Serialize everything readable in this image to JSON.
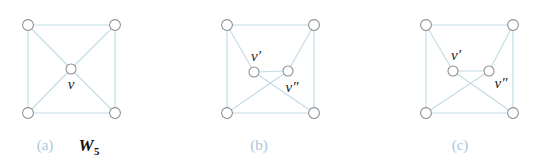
{
  "figure": {
    "background_color": "#ffffff",
    "edge_color": "#c3dce8",
    "node_stroke_color": "#8b8b8b",
    "node_fill_color": "#ffffff",
    "caption_tag_color": "#a8c6da",
    "label_color": "#1b1b1b",
    "width": 544,
    "height": 165
  },
  "panels": [
    {
      "id": "panel-a",
      "caption_tag": "(a)",
      "caption_name": "W",
      "caption_name_sub": "5",
      "caption_tag_x": 45,
      "caption_tag_y": 150,
      "caption_name_x": 86,
      "caption_name_y": 151,
      "nodes": [
        {
          "name": "top-left",
          "x": 28,
          "y": 25,
          "r": 5.4,
          "label": ""
        },
        {
          "name": "top-right",
          "x": 115,
          "y": 25,
          "r": 5.4,
          "label": ""
        },
        {
          "name": "bottom-left",
          "x": 28,
          "y": 113,
          "r": 5.4,
          "label": ""
        },
        {
          "name": "bottom-right",
          "x": 115,
          "y": 113,
          "r": 5.4,
          "label": ""
        },
        {
          "name": "center",
          "x": 71,
          "y": 69,
          "r": 5.0,
          "label": "v",
          "label_x": 71,
          "label_y": 89
        }
      ],
      "edges": [
        {
          "from": "top-left",
          "to": "top-right"
        },
        {
          "from": "top-right",
          "to": "bottom-right"
        },
        {
          "from": "bottom-right",
          "to": "bottom-left"
        },
        {
          "from": "bottom-left",
          "to": "top-left"
        },
        {
          "from": "center",
          "to": "top-left"
        },
        {
          "from": "center",
          "to": "top-right"
        },
        {
          "from": "center",
          "to": "bottom-left"
        },
        {
          "from": "center",
          "to": "bottom-right"
        }
      ]
    },
    {
      "id": "panel-b",
      "caption_tag": "(b)",
      "caption_name": "",
      "caption_name_sub": "",
      "caption_tag_x": 259,
      "caption_tag_y": 150,
      "nodes": [
        {
          "name": "top-left",
          "x": 227,
          "y": 25,
          "r": 5.4,
          "label": ""
        },
        {
          "name": "top-right",
          "x": 314,
          "y": 25,
          "r": 5.4,
          "label": ""
        },
        {
          "name": "bottom-left",
          "x": 227,
          "y": 113,
          "r": 5.4,
          "label": ""
        },
        {
          "name": "bottom-right",
          "x": 314,
          "y": 113,
          "r": 5.4,
          "label": ""
        },
        {
          "name": "v-prime",
          "x": 254,
          "y": 72,
          "r": 5.0,
          "label": "v′",
          "label_x": 256,
          "label_y": 61
        },
        {
          "name": "v-doubleprime",
          "x": 288,
          "y": 71,
          "r": 5.0,
          "label": "v″",
          "label_x": 292,
          "label_y": 92
        }
      ],
      "edges": [
        {
          "from": "top-left",
          "to": "top-right"
        },
        {
          "from": "top-right",
          "to": "bottom-right"
        },
        {
          "from": "bottom-right",
          "to": "bottom-left"
        },
        {
          "from": "bottom-left",
          "to": "top-left"
        },
        {
          "from": "v-prime",
          "to": "v-doubleprime"
        },
        {
          "from": "v-prime",
          "to": "top-left"
        },
        {
          "from": "v-prime",
          "to": "bottom-right"
        },
        {
          "from": "v-doubleprime",
          "to": "top-right"
        },
        {
          "from": "v-doubleprime",
          "to": "bottom-left"
        }
      ]
    },
    {
      "id": "panel-c",
      "caption_tag": "(c)",
      "caption_name": "",
      "caption_name_sub": "",
      "caption_tag_x": 460,
      "caption_tag_y": 150,
      "nodes": [
        {
          "name": "top-left",
          "x": 426,
          "y": 25,
          "r": 5.4,
          "label": ""
        },
        {
          "name": "top-right",
          "x": 513,
          "y": 25,
          "r": 5.4,
          "label": ""
        },
        {
          "name": "bottom-left",
          "x": 426,
          "y": 113,
          "r": 5.4,
          "label": ""
        },
        {
          "name": "bottom-right",
          "x": 513,
          "y": 113,
          "r": 5.4,
          "label": ""
        },
        {
          "name": "v-prime",
          "x": 453,
          "y": 71,
          "r": 5.0,
          "label": "v′",
          "label_x": 456,
          "label_y": 60
        },
        {
          "name": "v-doubleprime",
          "x": 489,
          "y": 71,
          "r": 5.0,
          "label": "v″",
          "label_x": 501,
          "label_y": 88
        }
      ],
      "edges": [
        {
          "from": "top-left",
          "to": "top-right"
        },
        {
          "from": "top-right",
          "to": "bottom-right"
        },
        {
          "from": "bottom-right",
          "to": "bottom-left"
        },
        {
          "from": "bottom-left",
          "to": "top-left"
        },
        {
          "from": "v-prime",
          "to": "v-doubleprime"
        },
        {
          "from": "v-prime",
          "to": "top-left"
        },
        {
          "from": "v-prime",
          "to": "bottom-right"
        },
        {
          "from": "v-doubleprime",
          "to": "top-right"
        },
        {
          "from": "v-doubleprime",
          "to": "bottom-left"
        }
      ]
    }
  ]
}
